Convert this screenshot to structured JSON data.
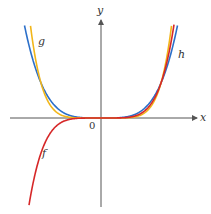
{
  "axes": {
    "x_label": "x",
    "y_label": "y",
    "origin_label": "0"
  },
  "colors": {
    "f": "#d62728",
    "g": "#f2b619",
    "h": "#2b6fc9",
    "axis": "#555555"
  },
  "curves": [
    {
      "name": "f",
      "label": "f",
      "expr": "x^5",
      "color": "#d62728"
    },
    {
      "name": "g",
      "label": "g",
      "expr": "x^6",
      "color": "#f2b619"
    },
    {
      "name": "h",
      "label": "h",
      "expr": "x^4",
      "color": "#2b6fc9"
    }
  ],
  "layout": {
    "origin_px": [
      101,
      118
    ],
    "unit_x_px": 60,
    "unit_y_px": 35
  }
}
